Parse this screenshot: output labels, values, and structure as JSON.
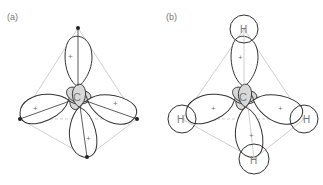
{
  "panels": [
    {
      "label": "(a)",
      "center_atom": "C",
      "lobe_signs": {
        "large": "+",
        "small": "−"
      }
    },
    {
      "label": "(b)",
      "center_atom": "C",
      "hydrogens": [
        "H",
        "H",
        "H",
        "H"
      ],
      "lobe_signs": {
        "large": "+",
        "small": "−"
      }
    }
  ],
  "colors": {
    "outline": "#333333",
    "shade": "#d8d8d8",
    "guide": "#bbbbbb"
  }
}
